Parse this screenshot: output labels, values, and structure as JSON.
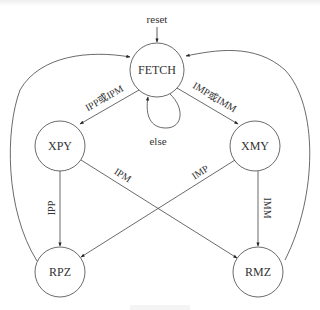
{
  "diagram": {
    "type": "state-machine",
    "states": [
      {
        "id": "FETCH",
        "label": "FETCH"
      },
      {
        "id": "XPY",
        "label": "XPY"
      },
      {
        "id": "XMY",
        "label": "XMY"
      },
      {
        "id": "RPZ",
        "label": "RPZ"
      },
      {
        "id": "RMZ",
        "label": "RMZ"
      }
    ],
    "transitions": [
      {
        "from": "reset",
        "to": "FETCH",
        "label": "reset"
      },
      {
        "from": "FETCH",
        "to": "FETCH",
        "label": "else"
      },
      {
        "from": "FETCH",
        "to": "XPY",
        "label": "IPP或IPM"
      },
      {
        "from": "FETCH",
        "to": "XMY",
        "label": "IMP或IMM"
      },
      {
        "from": "XPY",
        "to": "RPZ",
        "label": "IPP"
      },
      {
        "from": "XPY",
        "to": "RMZ",
        "label": "IPM"
      },
      {
        "from": "XMY",
        "to": "RPZ",
        "label": "IMP"
      },
      {
        "from": "XMY",
        "to": "RMZ",
        "label": "IMM"
      },
      {
        "from": "RPZ",
        "to": "FETCH",
        "label": ""
      },
      {
        "from": "RMZ",
        "to": "FETCH",
        "label": ""
      }
    ]
  },
  "labels": {
    "reset": "reset",
    "else": "else",
    "fetch_to_xpy": "IPP或IPM",
    "fetch_to_xmy": "IMP或IMM",
    "xpy_to_rpz": "IPP",
    "xpy_to_rmz": "IPM",
    "xmy_to_rpz": "IMP",
    "xmy_to_rmz": "IMM"
  },
  "nodes": {
    "fetch": "FETCH",
    "xpy": "XPY",
    "xmy": "XMY",
    "rpz": "RPZ",
    "rmz": "RMZ"
  }
}
